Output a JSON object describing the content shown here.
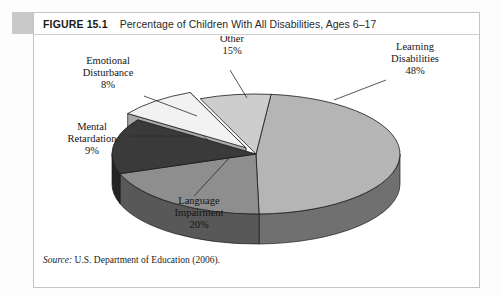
{
  "figure": {
    "number_label": "FIGURE 15.1",
    "title": "Percentage of Children With All Disabilities, Ages 6–17",
    "source_prefix": "Source:",
    "source_text": "U.S. Department of Education (2006)."
  },
  "chart_data": {
    "type": "pie",
    "title": "Percentage of Children With All Disabilities, Ages 6–17",
    "three_d": true,
    "exploded_slice": "Mental Retardation",
    "categories": [
      "Learning Disabilities",
      "Language Impairment",
      "Other",
      "Mental Retardation",
      "Emotional Disturbance"
    ],
    "values": [
      48,
      20,
      15,
      9,
      8
    ],
    "unit": "%",
    "colors": [
      "#b5b5b5",
      "#8e8e8e",
      "#3a3a3a",
      "#f2f2f2",
      "#cdcdcd"
    ],
    "legend": "none",
    "labels": [
      {
        "name": "Learning Disabilities",
        "line1": "Learning",
        "line2": "Disabilities",
        "value_text": "48%"
      },
      {
        "name": "Language Impairment",
        "line1": "Language",
        "line2": "Impairment",
        "value_text": "20%"
      },
      {
        "name": "Other",
        "line1": "Other",
        "line2": "",
        "value_text": "15%"
      },
      {
        "name": "Mental Retardation",
        "line1": "Mental",
        "line2": "Retardation",
        "value_text": "9%"
      },
      {
        "name": "Emotional Disturbance",
        "line1": "Emotional",
        "line2": "Disturbance",
        "value_text": "8%"
      }
    ]
  }
}
